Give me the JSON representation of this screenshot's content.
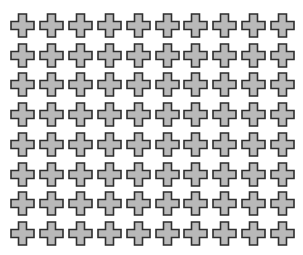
{
  "grid": {
    "rows": 8,
    "cols": 10,
    "origin_x": 10,
    "origin_y": 13,
    "pitch_x": 28.9,
    "pitch_y": 29.7,
    "shape": "plus-cross",
    "fill_color": "#b9b9b9",
    "stroke_color": "#2e2e2e"
  }
}
